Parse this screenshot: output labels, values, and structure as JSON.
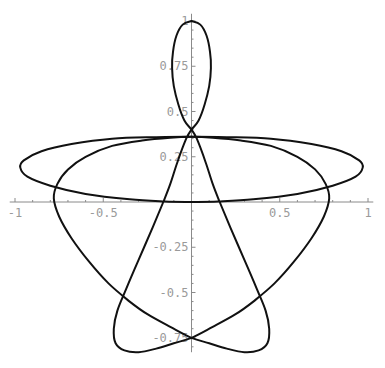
{
  "chart_data": {
    "type": "line",
    "title": "",
    "xlabel": "",
    "ylabel": "",
    "xlim": [
      -1,
      1
    ],
    "ylim": [
      -0.85,
      1
    ],
    "grid": false,
    "legend": "none",
    "colors": {
      "curve": "#111111",
      "axis": "#8a8a8a",
      "tick_label": "#9a9a9a"
    },
    "x_ticks": [
      {
        "value": -1,
        "label": "-1"
      },
      {
        "value": -0.5,
        "label": "-0.5"
      },
      {
        "value": 0.5,
        "label": "0.5"
      },
      {
        "value": 1,
        "label": "1"
      }
    ],
    "y_ticks": [
      {
        "value": 1,
        "label": "1"
      },
      {
        "value": 0.75,
        "label": "0.75"
      },
      {
        "value": 0.5,
        "label": "0.5"
      },
      {
        "value": 0.25,
        "label": "0.25"
      },
      {
        "value": -0.25,
        "label": "-0.25"
      },
      {
        "value": -0.5,
        "label": "-0.5"
      },
      {
        "value": -0.75,
        "label": "-0.75"
      }
    ],
    "series": [
      {
        "name": "parametric-curve",
        "symmetric_about_y_axis": true,
        "right_half_points": [
          [
            0,
            1.0
          ],
          [
            0.05,
            0.98
          ],
          [
            0.085,
            0.92
          ],
          [
            0.105,
            0.83
          ],
          [
            0.11,
            0.74
          ],
          [
            0.1,
            0.64
          ],
          [
            0.075,
            0.54
          ],
          [
            0.04,
            0.45
          ],
          [
            0.0,
            0.4
          ],
          [
            -0.03,
            0.35
          ],
          [
            -0.08,
            0.22
          ],
          [
            -0.12,
            0.1
          ],
          [
            -0.16,
            0.0
          ],
          [
            -0.22,
            -0.14
          ],
          [
            -0.3,
            -0.32
          ],
          [
            -0.37,
            -0.48
          ],
          [
            -0.42,
            -0.6
          ],
          [
            -0.44,
            -0.7
          ],
          [
            -0.43,
            -0.78
          ],
          [
            -0.38,
            -0.82
          ],
          [
            -0.3,
            -0.83
          ],
          [
            -0.2,
            -0.81
          ],
          [
            -0.1,
            -0.78
          ],
          [
            0.0,
            -0.75
          ],
          [
            0.12,
            -0.69
          ],
          [
            0.25,
            -0.62
          ],
          [
            0.35,
            -0.55
          ],
          [
            0.47,
            -0.45
          ],
          [
            0.58,
            -0.33
          ],
          [
            0.68,
            -0.2
          ],
          [
            0.75,
            -0.08
          ],
          [
            0.78,
            0.02
          ],
          [
            0.76,
            0.1
          ],
          [
            0.7,
            0.18
          ],
          [
            0.6,
            0.25
          ],
          [
            0.45,
            0.31
          ],
          [
            0.28,
            0.34
          ],
          [
            0.12,
            0.355
          ],
          [
            0.0,
            0.36
          ],
          [
            -0.2,
            0.358
          ],
          [
            -0.45,
            0.35
          ],
          [
            -0.68,
            0.32
          ],
          [
            -0.85,
            0.28
          ],
          [
            -0.95,
            0.23
          ],
          [
            -0.97,
            0.19
          ],
          [
            -0.93,
            0.14
          ],
          [
            -0.8,
            0.09
          ],
          [
            -0.6,
            0.045
          ],
          [
            -0.35,
            0.015
          ],
          [
            -0.15,
            0.003
          ],
          [
            0.0,
            0.0
          ]
        ]
      }
    ]
  }
}
